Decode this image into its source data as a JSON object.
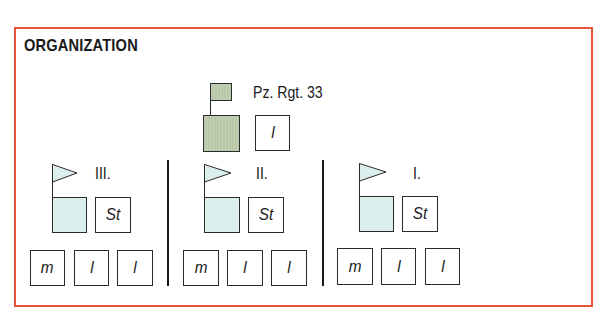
{
  "title": "ORGANIZATION",
  "colors": {
    "frame": "#e8543a",
    "regiment_fill": "#b9c8a8",
    "battalion_fill": "#dcefef"
  },
  "regiment": {
    "label": "Pz. Rgt. 33",
    "sub_unit": "l"
  },
  "battalions": [
    {
      "label": "III.",
      "staff": "St",
      "companies": [
        "m",
        "l",
        "l"
      ]
    },
    {
      "label": "II.",
      "staff": "St",
      "companies": [
        "m",
        "l",
        "l"
      ]
    },
    {
      "label": "I.",
      "staff": "St",
      "companies": [
        "m",
        "l",
        "l"
      ]
    }
  ]
}
